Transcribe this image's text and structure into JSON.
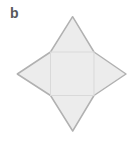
{
  "figure": {
    "label": "b"
  },
  "colors": {
    "background": "#ffffff",
    "shape_fill": "#ececec",
    "outline": "#b1b1b1",
    "inner_line": "#d9d9d9",
    "label": "#58595b"
  },
  "shape": {
    "type": "square-pyramid-net",
    "viewbox": "0 0 136 145",
    "star_points": "72.6,16.7 94,52 126,74 94,95.5 72.7,131 50.5,95.5 17.3,74 50.5,52",
    "square": {
      "x": "50.5",
      "y": "52",
      "w": "43.5",
      "h": "43.5"
    }
  }
}
